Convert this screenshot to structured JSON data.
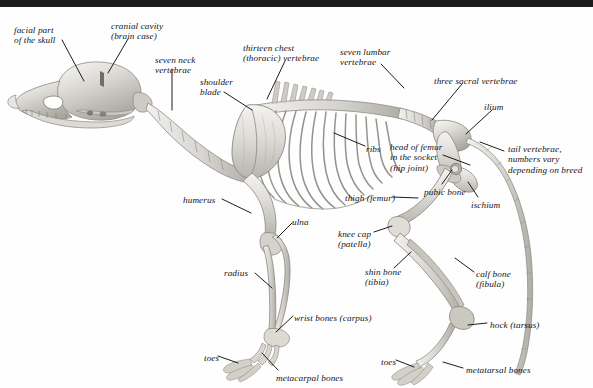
{
  "figure": {
    "background_color": "#fefefe",
    "top_bar_color": "#1c1c1c",
    "label_color": "#14141a",
    "leader_line_color": "#111111",
    "bone_fill_light": "#f2f1ee",
    "bone_fill_mid": "#d8d6d1",
    "bone_fill_dark": "#b3b0aa",
    "bone_outline": "#8d8a84"
  },
  "labels": [
    {
      "id": "facial-part-of-the-skull",
      "text": "facial part\nof the skull",
      "x": 14,
      "y": 18,
      "align": "left"
    },
    {
      "id": "cranial-cavity-brain-case",
      "text": "cranial cavity\n(brain case)",
      "x": 111,
      "y": 14,
      "align": "left"
    },
    {
      "id": "seven-neck-vertebrae",
      "text": "seven neck\nvertebrae",
      "x": 155,
      "y": 48,
      "align": "left"
    },
    {
      "id": "thirteen-chest-thoracic-vertebrae",
      "text": "thirteen chest\n(thoracic) vertebrae",
      "x": 243,
      "y": 36,
      "align": "left"
    },
    {
      "id": "shoulder-blade",
      "text": "shoulder\nblade",
      "x": 200,
      "y": 70,
      "align": "left"
    },
    {
      "id": "seven-lumbar-vertebrae",
      "text": "seven lumbar\nvertebrae",
      "x": 340,
      "y": 40,
      "align": "left"
    },
    {
      "id": "three-sacral-vertebrae",
      "text": "three sacral vertebrae",
      "x": 434,
      "y": 69,
      "align": "left"
    },
    {
      "id": "ilium",
      "text": "ilium",
      "x": 484,
      "y": 95,
      "align": "left"
    },
    {
      "id": "ribs",
      "text": "ribs",
      "x": 366,
      "y": 137,
      "align": "left"
    },
    {
      "id": "tail-vertebrae",
      "text": "tail vertebrae,\nnumbers vary\ndepending on breed",
      "x": 508,
      "y": 137,
      "align": "left"
    },
    {
      "id": "head-of-femur-in-the-socket-hip-joint",
      "text": "head of femur\nin the socket\n(hip joint)",
      "x": 390,
      "y": 135,
      "align": "left"
    },
    {
      "id": "pubic-bone",
      "text": "pubic bone",
      "x": 424,
      "y": 180,
      "align": "left"
    },
    {
      "id": "ischium",
      "text": "ischium",
      "x": 471,
      "y": 193,
      "align": "left"
    },
    {
      "id": "thigh-femur",
      "text": "thigh (femur)",
      "x": 345,
      "y": 186,
      "align": "left"
    },
    {
      "id": "humerus",
      "text": "humerus",
      "x": 183,
      "y": 188,
      "align": "left"
    },
    {
      "id": "ulna",
      "text": "ulna",
      "x": 292,
      "y": 210,
      "align": "left"
    },
    {
      "id": "knee-cap-patella",
      "text": "knee cap\n(patella)",
      "x": 338,
      "y": 222,
      "align": "left"
    },
    {
      "id": "calf-bone-fibula",
      "text": "calf bone\n(fibula)",
      "x": 476,
      "y": 262,
      "align": "left"
    },
    {
      "id": "radius",
      "text": "radius",
      "x": 224,
      "y": 261,
      "align": "left"
    },
    {
      "id": "shin-bone-tibia",
      "text": "shin bone\n(tibia)",
      "x": 365,
      "y": 260,
      "align": "left"
    },
    {
      "id": "wrist-bones-carpus",
      "text": "wrist bones (carpus)",
      "x": 294,
      "y": 306,
      "align": "left"
    },
    {
      "id": "hock-tarsus",
      "text": "hock (tarsus)",
      "x": 490,
      "y": 313,
      "align": "left"
    },
    {
      "id": "toes-front",
      "text": "toes",
      "x": 204,
      "y": 346,
      "align": "left"
    },
    {
      "id": "toes-hind",
      "text": "toes",
      "x": 381,
      "y": 350,
      "align": "left"
    },
    {
      "id": "metacarpal-bones",
      "text": "metacarpal bones",
      "x": 276,
      "y": 366,
      "align": "left"
    },
    {
      "id": "metatarsal-bones",
      "text": "metatarsal bones",
      "x": 466,
      "y": 358,
      "align": "left"
    }
  ],
  "leader_lines": [
    {
      "id": "leader-facial-part",
      "from": [
        62,
        33
      ],
      "to": [
        84,
        74
      ]
    },
    {
      "id": "leader-cranial-cavity",
      "from": [
        128,
        32
      ],
      "to": [
        108,
        66
      ]
    },
    {
      "id": "leader-seven-neck",
      "from": [
        172,
        62
      ],
      "to": [
        172,
        103
      ]
    },
    {
      "id": "leader-thirteen-chest",
      "from": [
        285,
        54
      ],
      "to": [
        267,
        92
      ]
    },
    {
      "id": "leader-shoulder-blade",
      "from": [
        224,
        85
      ],
      "to": [
        252,
        103
      ]
    },
    {
      "id": "leader-seven-lumbar",
      "from": [
        381,
        57
      ],
      "to": [
        404,
        81
      ]
    },
    {
      "id": "leader-three-sacral",
      "from": [
        462,
        77
      ],
      "to": [
        432,
        113
      ]
    },
    {
      "id": "leader-ilium",
      "from": [
        492,
        103
      ],
      "to": [
        466,
        127
      ]
    },
    {
      "id": "leader-ribs",
      "from": [
        365,
        139
      ],
      "to": [
        334,
        126
      ]
    },
    {
      "id": "leader-tail-vertebrae",
      "from": [
        504,
        144
      ],
      "to": [
        480,
        135
      ]
    },
    {
      "id": "leader-head-of-femur",
      "from": [
        443,
        148
      ],
      "to": [
        470,
        158
      ]
    },
    {
      "id": "leader-pubic-bone",
      "from": [
        442,
        177
      ],
      "to": [
        452,
        163
      ]
    },
    {
      "id": "leader-ischium",
      "from": [
        478,
        190
      ],
      "to": [
        468,
        175
      ]
    },
    {
      "id": "leader-thigh-femur",
      "from": [
        392,
        190
      ],
      "to": [
        418,
        191
      ]
    },
    {
      "id": "leader-humerus",
      "from": [
        222,
        192
      ],
      "to": [
        251,
        206
      ]
    },
    {
      "id": "leader-ulna",
      "from": [
        292,
        216
      ],
      "to": [
        277,
        231
      ]
    },
    {
      "id": "leader-knee-cap",
      "from": [
        374,
        225
      ],
      "to": [
        392,
        219
      ]
    },
    {
      "id": "leader-calf-bone",
      "from": [
        474,
        265
      ],
      "to": [
        455,
        251
      ]
    },
    {
      "id": "leader-radius",
      "from": [
        255,
        266
      ],
      "to": [
        272,
        281
      ]
    },
    {
      "id": "leader-shin-bone",
      "from": [
        394,
        261
      ],
      "to": [
        411,
        245
      ]
    },
    {
      "id": "leader-wrist-bones",
      "from": [
        293,
        309
      ],
      "to": [
        276,
        325
      ]
    },
    {
      "id": "leader-hock-tarsus",
      "from": [
        487,
        316
      ],
      "to": [
        468,
        318
      ]
    },
    {
      "id": "leader-toes-front",
      "from": [
        218,
        349
      ],
      "to": [
        238,
        356
      ]
    },
    {
      "id": "leader-toes-hind",
      "from": [
        396,
        353
      ],
      "to": [
        414,
        360
      ]
    },
    {
      "id": "leader-metacarpal-bones",
      "from": [
        278,
        363
      ],
      "to": [
        262,
        346
      ]
    },
    {
      "id": "leader-metatarsal-bones",
      "from": [
        463,
        361
      ],
      "to": [
        443,
        355
      ]
    }
  ]
}
